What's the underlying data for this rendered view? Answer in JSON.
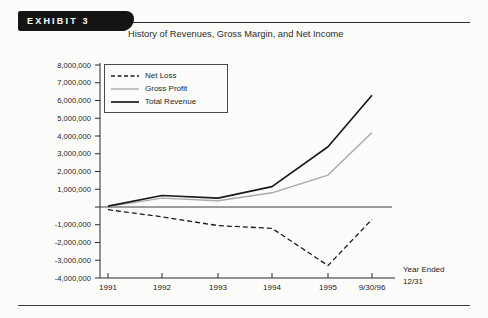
{
  "page": {
    "exhibit_label": "EXHIBIT 3",
    "title": "History of Revenues, Gross Margin, and Net Income"
  },
  "chart_data": {
    "type": "line",
    "title": "History of Revenues, Gross Margin, and Net Income",
    "categories": [
      "1991",
      "1992",
      "1993",
      "1994",
      "1995",
      "9/30/96"
    ],
    "x_axis_note": [
      "Year Ended",
      "12/31"
    ],
    "xlabel": "Year Ended 12/31",
    "ylabel": "",
    "ylim": [
      -4000000,
      8000000
    ],
    "ytick_step": 1000000,
    "y_tick_labels": [
      "8,000,000",
      "7,000,000",
      "6,000,000",
      "5,000,000",
      "4,000,000",
      "3,000,000",
      "2,000,000",
      "1,000,000",
      "",
      "-1,000,000",
      "-2,000,000",
      "-3,000,000",
      "-4,000,000"
    ],
    "grid": false,
    "legend_position": "top-left",
    "axis_color": "#2b2b2b",
    "series": [
      {
        "name": "Net Loss",
        "line_style": "dashed",
        "color": "#1a1a1a",
        "width": 1.3,
        "values": [
          -150000,
          -550000,
          -1050000,
          -1200000,
          -3300000,
          -700000
        ]
      },
      {
        "name": "Gross Profit",
        "line_style": "solid",
        "color": "#a9a9a9",
        "width": 1.4,
        "values": [
          20000,
          500000,
          350000,
          800000,
          1800000,
          4200000
        ]
      },
      {
        "name": "Total Revenue",
        "line_style": "solid",
        "color": "#1a1a1a",
        "width": 1.7,
        "values": [
          50000,
          650000,
          500000,
          1150000,
          3400000,
          6300000
        ]
      }
    ]
  }
}
